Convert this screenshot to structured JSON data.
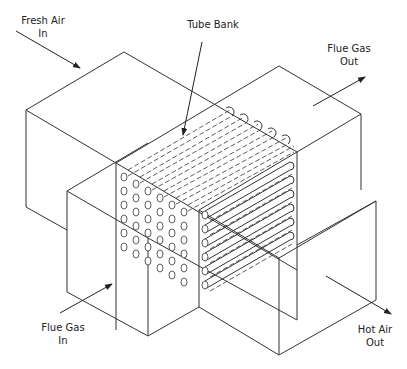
{
  "diagram": {
    "labels": {
      "fresh_air_in": "Fresh Air\nIn",
      "tube_bank": "Tube Bank",
      "flue_gas_out": "Flue Gas\nOut",
      "flue_gas_in": "Flue Gas\nIn",
      "hot_air_out": "Hot Air\nOut"
    },
    "tube_grid": {
      "rows": 6,
      "columns": 5
    },
    "colors": {
      "line": "#333333",
      "background": "#ffffff",
      "text": "#222222"
    }
  }
}
